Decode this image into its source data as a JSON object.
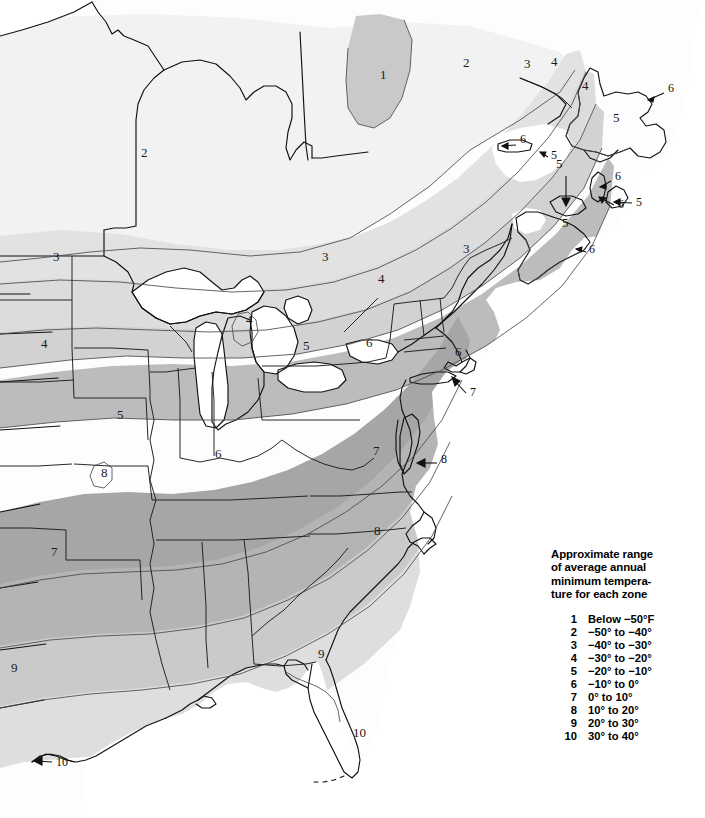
{
  "document": {
    "type": "plant-hardiness-zone-map",
    "region_depicted": "Eastern United States and Eastern Canada"
  },
  "legend": {
    "heading": "Approximate range\nof average annual\nminimum tempera-\nture for each zone",
    "rows": [
      {
        "zone": "1",
        "range": "Below −50°F"
      },
      {
        "zone": "2",
        "range": "−50° to −40°"
      },
      {
        "zone": "3",
        "range": "−40° to −30°"
      },
      {
        "zone": "4",
        "range": "−30° to −20°"
      },
      {
        "zone": "5",
        "range": "−20° to −10°"
      },
      {
        "zone": "6",
        "range": "−10° to 0°"
      },
      {
        "zone": "7",
        "range": "0° to 10°"
      },
      {
        "zone": "8",
        "range": "10° to 20°"
      },
      {
        "zone": "9",
        "range": "20° to 30°"
      },
      {
        "zone": "10",
        "range": "30° to 40°"
      }
    ]
  },
  "zone_colors": {
    "zone1": "#c9c9c9",
    "zone2": "#f2f2f2",
    "zone3": "#e2e2e2",
    "zone4": "#dcdcdc",
    "zone5": "#d2d2d2",
    "zone6": "#bcbcbc",
    "zone7": "#a6a6a6",
    "zone8": "#b4b4b4",
    "zone9": "#cacaca",
    "zone10": "#dedede",
    "water": "#ffffff",
    "outline": "#111111",
    "zone_boundary": "#555555"
  },
  "map_labels": [
    {
      "id": "lbl-1-quebec",
      "text": "1",
      "x": 380,
      "y": 79,
      "zone": 1
    },
    {
      "id": "lbl-2-ontario",
      "text": "2",
      "x": 141,
      "y": 157,
      "zone": 2
    },
    {
      "id": "lbl-2-quebec",
      "text": "2",
      "x": 463,
      "y": 67,
      "zone": 2
    },
    {
      "id": "lbl-3-quebec",
      "text": "3",
      "x": 524,
      "y": 68,
      "zone": 3
    },
    {
      "id": "lbl-4-gulf-stlaw",
      "text": "4",
      "x": 551,
      "y": 66,
      "zone": 4
    },
    {
      "id": "lbl-4-newfoundland",
      "text": "4",
      "x": 582,
      "y": 90,
      "zone": 4
    },
    {
      "id": "lbl-5-newfoundland",
      "text": "5",
      "x": 613,
      "y": 122,
      "zone": 5
    },
    {
      "id": "lbl-5-capebreton",
      "text": "5",
      "x": 556,
      "y": 168,
      "zone": 5
    },
    {
      "id": "lbl-5-novascotia",
      "text": "5",
      "x": 562,
      "y": 227,
      "zone": 5
    },
    {
      "id": "lbl-3-dakotas",
      "text": "3",
      "x": 53,
      "y": 261,
      "zone": 3
    },
    {
      "id": "lbl-3-nengland",
      "text": "3",
      "x": 463,
      "y": 253,
      "zone": 3
    },
    {
      "id": "lbl-3-ontario-s",
      "text": "3",
      "x": 322,
      "y": 261,
      "zone": 3
    },
    {
      "id": "lbl-4-plains",
      "text": "4",
      "x": 41,
      "y": 348,
      "zone": 4
    },
    {
      "id": "lbl-4-michigan",
      "text": "4",
      "x": 246,
      "y": 324,
      "zone": 4
    },
    {
      "id": "lbl-4-ontario-l",
      "text": "4",
      "x": 378,
      "y": 283,
      "zone": 4
    },
    {
      "id": "lbl-5-midwest",
      "text": "5",
      "x": 117,
      "y": 419,
      "zone": 5
    },
    {
      "id": "lbl-5-lakeerie",
      "text": "5",
      "x": 303,
      "y": 350,
      "zone": 5
    },
    {
      "id": "lbl-6-ohio",
      "text": "6",
      "x": 215,
      "y": 458,
      "zone": 6
    },
    {
      "id": "lbl-6-penn",
      "text": "6",
      "x": 366,
      "y": 347,
      "zone": 6
    },
    {
      "id": "lbl-6-newengland",
      "text": "6",
      "x": 455,
      "y": 356,
      "zone": 6
    },
    {
      "id": "lbl-8-ozarks",
      "text": "8",
      "x": 101,
      "y": 477,
      "zone": 8
    },
    {
      "id": "lbl-7-arkansas",
      "text": "7",
      "x": 51,
      "y": 556,
      "zone": 7
    },
    {
      "id": "lbl-7-appalachia",
      "text": "7",
      "x": 373,
      "y": 455,
      "zone": 7
    },
    {
      "id": "lbl-8-carolina",
      "text": "8",
      "x": 374,
      "y": 535,
      "zone": 8
    },
    {
      "id": "lbl-9-georgia",
      "text": "9",
      "x": 318,
      "y": 658,
      "zone": 9
    },
    {
      "id": "lbl-9-texas",
      "text": "9",
      "x": 11,
      "y": 672,
      "zone": 9
    },
    {
      "id": "lbl-10-florida",
      "text": "10",
      "x": 353,
      "y": 737,
      "zone": 10
    }
  ],
  "map_callouts": [
    {
      "id": "callout-newfoundland-ne",
      "text": "6",
      "label_x": 668,
      "label_y": 92,
      "tip_x": 645,
      "tip_y": 101
    },
    {
      "id": "callout-newfoundland-e",
      "text": "6",
      "label_x": 618,
      "label_y": 208,
      "tip_x": 596,
      "tip_y": 196
    },
    {
      "id": "callout-stpierre",
      "text": "6",
      "label_x": 520,
      "label_y": 143,
      "tip_x": 500,
      "tip_y": 146
    },
    {
      "id": "callout-anticosti",
      "text": "5",
      "label_x": 551,
      "label_y": 159,
      "tip_x": 538,
      "tip_y": 152
    },
    {
      "id": "callout-pei",
      "text": "6",
      "label_x": 615,
      "label_y": 180,
      "tip_x": 598,
      "tip_y": 188
    },
    {
      "id": "callout-capebreton",
      "text": "5",
      "label_x": 636,
      "label_y": 206,
      "tip_x": 612,
      "tip_y": 202
    },
    {
      "id": "callout-magdalen",
      "text": "",
      "label_x": 566,
      "label_y": 177,
      "tip_x": 566,
      "tip_y": 207
    },
    {
      "id": "callout-novascotia-s",
      "text": "6",
      "label_x": 589,
      "label_y": 253,
      "tip_x": 575,
      "tip_y": 249
    },
    {
      "id": "callout-longisland",
      "text": "7",
      "label_x": 470,
      "label_y": 396,
      "tip_x": 452,
      "tip_y": 378
    },
    {
      "id": "callout-delmarva",
      "text": "8",
      "label_x": 441,
      "label_y": 463,
      "tip_x": 418,
      "tip_y": 463
    },
    {
      "id": "callout-stexas",
      "text": "10",
      "label_x": 56,
      "label_y": 766,
      "tip_x": 34,
      "tip_y": 760
    }
  ]
}
